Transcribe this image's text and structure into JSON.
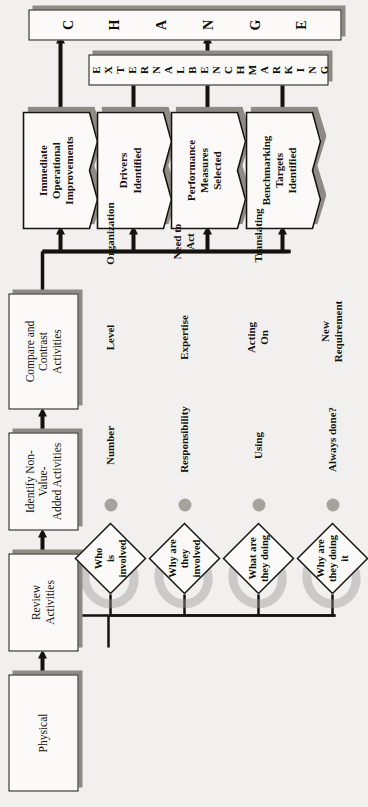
{
  "diagram": {
    "orientation": "page rotated 90 degrees counter-clockwise",
    "banners": [
      {
        "id": "change",
        "text": "CHANGE",
        "letters": [
          "C",
          "H",
          "A",
          "N",
          "G",
          "E"
        ]
      },
      {
        "id": "external-benchmarking",
        "text": "EXTERNAL BENCHMARKING",
        "letters": [
          "E",
          "X",
          "T",
          "E",
          "R",
          "N",
          "A",
          "L",
          " ",
          "B",
          "E",
          "N",
          "C",
          "H",
          "M",
          "A",
          "R",
          "K",
          "I",
          "N",
          "G"
        ]
      }
    ],
    "process_boxes": [
      {
        "id": "physical",
        "label": "Physical"
      },
      {
        "id": "review-activities",
        "label": "Review\nActivities"
      },
      {
        "id": "identify-non-value",
        "label": "Identify Non-\nValue-\nAdded Activities"
      },
      {
        "id": "compare-contrast",
        "label": "Compare and\nContrast\nActivities"
      }
    ],
    "output_documents": [
      {
        "id": "immediate-operational-improvements",
        "label": "Immediate\nOperational\nImprovements"
      },
      {
        "id": "drivers-identified",
        "label": "Drivers\nIdentified"
      },
      {
        "id": "performance-measures-selected",
        "label": "Performance\nMeasures\nSelected"
      },
      {
        "id": "benchmarking-targets-identified",
        "label": "Benchmarking\nTargets\nIdentified"
      }
    ],
    "questions": [
      {
        "id": "who-is-involved",
        "label": "Who\nis\ninvolved"
      },
      {
        "id": "why-are-they-involved",
        "label": "Why are\nthey\ninvolved"
      },
      {
        "id": "what-are-they-doing",
        "label": "What are\nthey doing"
      },
      {
        "id": "why-are-they-doing-it",
        "label": "Why are\nthey doing\nit"
      }
    ],
    "answer_columns": [
      {
        "question": "who-is-involved",
        "items": [
          "Number",
          "Level",
          "Organization"
        ]
      },
      {
        "question": "why-are-they-involved",
        "items": [
          "Responsibility",
          "Expertise",
          "Need to\nAct"
        ]
      },
      {
        "question": "what-are-they-doing",
        "items": [
          "Using",
          "Acting\nOn",
          "Translating"
        ]
      },
      {
        "question": "why-are-they-doing-it",
        "items": [
          "Always done?",
          "New\nRequirement",
          ""
        ]
      }
    ],
    "colors": {
      "paper": "#f2f0ee",
      "fill": "#fbfaf8",
      "ink": "#17140f",
      "shadow": "#8e8a84",
      "dot": "#a6a29c",
      "smudge": "rgba(150,150,150,0.42)"
    }
  }
}
